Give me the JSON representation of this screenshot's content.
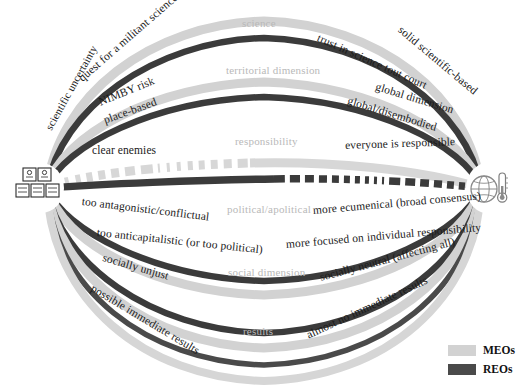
{
  "figure": {
    "type": "comparison-arc-diagram",
    "left_icon": "crowd-group-icon",
    "right_icon": "globe-thermometer-icon",
    "colors": {
      "meo": "#cfcfcf",
      "reo": "#3c3c3c",
      "center_label": "#b9b9b9",
      "label": "#1a1a1a",
      "background": "#ffffff"
    }
  },
  "legend": {
    "items": [
      {
        "key": "meo",
        "label": "MEOs",
        "color": "#cfcfcf"
      },
      {
        "key": "reo",
        "label": "REOs",
        "color": "#3c3c3c"
      }
    ]
  },
  "dimensions": [
    {
      "id": "science",
      "center_label": "science",
      "meo": {
        "left": "scientific uncertainty",
        "right": "solid scientific-based"
      },
      "reo": {
        "left": "quest for a militant science",
        "right": "trust in science tout court"
      }
    },
    {
      "id": "territorial",
      "center_label": "territorial dimension",
      "meo": {
        "left": "NIMBY risk",
        "right": "global dimension"
      },
      "reo": {
        "left": "place-based",
        "right": "global/disembodied"
      }
    },
    {
      "id": "responsibility",
      "center_label": "responsibility",
      "meo": {
        "left": "",
        "right": "everyone is responsible"
      },
      "reo": {
        "left": "clear enemies",
        "right": ""
      }
    },
    {
      "id": "political",
      "center_label": "political/apolitical",
      "meo": {
        "left": "too anticapitalistic (or too political)",
        "right": "more focused on individual responsibility"
      },
      "reo": {
        "left": "too antagonistic/conflictual",
        "right": "more ecumenical (broad consensus)"
      }
    },
    {
      "id": "social",
      "center_label": "social dimension",
      "meo": {
        "left": "",
        "right": ""
      },
      "reo": {
        "left": "socially unjust",
        "right": "socially neutral (affecting all)"
      }
    },
    {
      "id": "results",
      "center_label": "results",
      "meo": {
        "left": "",
        "right": ""
      },
      "reo": {
        "left": "possible immediate results",
        "right": "almost no immediate results"
      }
    }
  ],
  "labels": {
    "scientific_uncertainty": "scientific uncertainty",
    "quest_militant_science": "quest for a militant science",
    "trust_in_science": "trust in science tout court",
    "solid_scientific_based": "solid scientific-based",
    "science_center": "science",
    "nimby_risk": "NIMBY risk",
    "place_based": "place-based",
    "global_dimension": "global dimension",
    "global_disembodied": "global/disembodied",
    "territorial_center": "territorial dimension",
    "clear_enemies": "clear enemies",
    "everyone_responsible": "everyone is responsible",
    "responsibility_center": "responsibility",
    "too_antagonistic": "too antagonistic/conflictual",
    "more_ecumenical": "more ecumenical (broad consensus)",
    "political_center": "political/apolitical",
    "too_anticapitalistic": "too anticapitalistic (or too political)",
    "more_focused_individual": "more focused on individual responsibility",
    "socially_unjust": "socially unjust",
    "socially_neutral": "socially neutral (affecting all)",
    "social_center": "social dimension",
    "possible_immediate_results": "possible immediate results",
    "almost_no_immediate_results": "almost no immediate results",
    "results_center": "results"
  }
}
